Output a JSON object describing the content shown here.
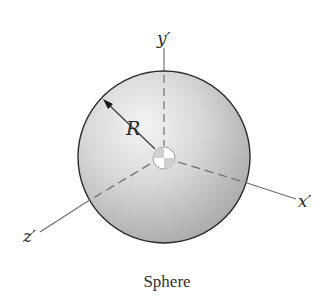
{
  "figure": {
    "caption": "Sphere",
    "labels": {
      "y_axis": "y′",
      "x_axis": "x′",
      "z_axis": "z′",
      "radius": "R"
    },
    "colors": {
      "sphere_light": "#f2f2f2",
      "sphere_mid": "#d0d0d0",
      "sphere_dark": "#a8a8a8",
      "outline": "#2a2a2a",
      "axis": "#777777",
      "text": "#2a2a2a"
    }
  }
}
